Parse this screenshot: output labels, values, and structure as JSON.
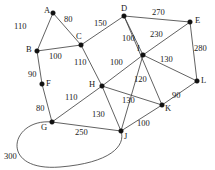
{
  "figure": {
    "width": 215,
    "height": 170,
    "background": "#ffffff",
    "edge_color": "#3a3a3a",
    "node_color": "#111111",
    "text_color": "#1a1a1a"
  },
  "chart_data": {
    "type": "diagram",
    "graph_type": "weighted-undirected-graph",
    "title": "",
    "nodes": [
      {
        "id": "A",
        "label": "A",
        "x": 53,
        "y": 13,
        "label_x": 44,
        "label_y": 6
      },
      {
        "id": "B",
        "label": "B",
        "x": 37,
        "y": 51,
        "label_x": 26,
        "label_y": 45
      },
      {
        "id": "C",
        "label": "C",
        "x": 81,
        "y": 45,
        "label_x": 76,
        "label_y": 32
      },
      {
        "id": "D",
        "label": "D",
        "x": 124,
        "y": 16,
        "label_x": 121,
        "label_y": 4
      },
      {
        "id": "E",
        "label": "E",
        "x": 190,
        "y": 22,
        "label_x": 195,
        "label_y": 16
      },
      {
        "id": "F",
        "label": "F",
        "x": 42,
        "y": 84,
        "label_x": 46,
        "label_y": 79
      },
      {
        "id": "G",
        "label": "G",
        "x": 52,
        "y": 122,
        "label_x": 41,
        "label_y": 123
      },
      {
        "id": "H",
        "label": "H",
        "x": 102,
        "y": 86,
        "label_x": 89,
        "label_y": 80
      },
      {
        "id": "I",
        "label": "I",
        "x": 143,
        "y": 55,
        "label_x": 137,
        "label_y": 44
      },
      {
        "id": "J",
        "label": "J",
        "x": 121,
        "y": 131,
        "label_x": 124,
        "label_y": 132
      },
      {
        "id": "K",
        "label": "K",
        "x": 162,
        "y": 105,
        "label_x": 165,
        "label_y": 104
      },
      {
        "id": "L",
        "label": "L",
        "x": 197,
        "y": 81,
        "label_x": 201,
        "label_y": 76
      }
    ],
    "edges": [
      {
        "from": "A",
        "to": "B",
        "weight": 110,
        "label_x": 14,
        "label_y": 22
      },
      {
        "from": "A",
        "to": "C",
        "weight": 80,
        "label_x": 64,
        "label_y": 15
      },
      {
        "from": "B",
        "to": "C",
        "weight": 100,
        "label_x": 49,
        "label_y": 52
      },
      {
        "from": "C",
        "to": "D",
        "weight": 150,
        "label_x": 94,
        "label_y": 19
      },
      {
        "from": "C",
        "to": "H",
        "weight": 110,
        "label_x": 74,
        "label_y": 58
      },
      {
        "from": "B",
        "to": "F",
        "weight": 90,
        "label_x": 28,
        "label_y": 70
      },
      {
        "from": "F",
        "to": "G",
        "weight": 80,
        "label_x": 36,
        "label_y": 104
      },
      {
        "from": "G",
        "to": "H",
        "weight": 110,
        "label_x": 65,
        "label_y": 93
      },
      {
        "from": "G",
        "to": "J",
        "weight": 250,
        "label_x": 75,
        "label_y": 128
      },
      {
        "from": "G",
        "to": "J",
        "weight": 300,
        "label_x": 4,
        "label_y": 152,
        "curved": true
      },
      {
        "from": "D",
        "to": "E",
        "weight": 270,
        "label_x": 152,
        "label_y": 8
      },
      {
        "from": "D",
        "to": "I",
        "weight": 100,
        "label_x": 122,
        "label_y": 34
      },
      {
        "from": "D",
        "to": "K",
        "weight": 230,
        "label_x": 150,
        "label_y": 30
      },
      {
        "from": "E",
        "to": "L",
        "weight": 280,
        "label_x": 194,
        "label_y": 44
      },
      {
        "from": "E",
        "to": "I",
        "weight": 230,
        "label_x": 0,
        "label_y": 0,
        "hidden_label": true
      },
      {
        "from": "H",
        "to": "I",
        "weight": 100,
        "label_x": 110,
        "label_y": 58
      },
      {
        "from": "I",
        "to": "L",
        "weight": 130,
        "label_x": 160,
        "label_y": 55
      },
      {
        "from": "I",
        "to": "J",
        "weight": 120,
        "label_x": 134,
        "label_y": 75
      },
      {
        "from": "H",
        "to": "K",
        "weight": 130,
        "label_x": 122,
        "label_y": 96
      },
      {
        "from": "H",
        "to": "J",
        "weight": 130,
        "label_x": 92,
        "label_y": 110
      },
      {
        "from": "J",
        "to": "K",
        "weight": 100,
        "label_x": 137,
        "label_y": 119
      },
      {
        "from": "K",
        "to": "L",
        "weight": 90,
        "label_x": 172,
        "label_y": 91
      }
    ],
    "curve_path": "M 52 122 C 10 118, -2 172, 60 167 C 110 163, 126 146, 121 131"
  }
}
